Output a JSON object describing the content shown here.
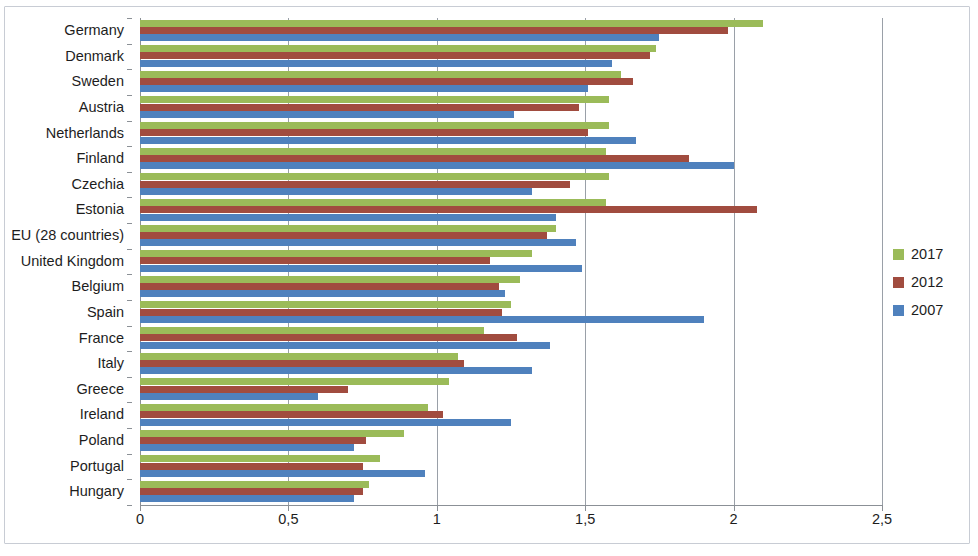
{
  "chart_data": {
    "type": "bar",
    "orientation": "horizontal",
    "title": "",
    "subtitle": "",
    "xlabel": "",
    "ylabel": "",
    "xlim": [
      0,
      2.5
    ],
    "x_ticks": [
      "0",
      "0,5",
      "1",
      "1,5",
      "2",
      "2,5"
    ],
    "x_tick_values": [
      0,
      0.5,
      1,
      1.5,
      2,
      2.5
    ],
    "grid": "vertical",
    "legend_position": "right",
    "categories": [
      "Germany",
      "Denmark",
      "Sweden",
      "Austria",
      "Netherlands",
      "Finland",
      "Czechia",
      "Estonia",
      "EU (28 countries)",
      "United Kingdom",
      "Belgium",
      "Spain",
      "France",
      "Italy",
      "Greece",
      "Ireland",
      "Poland",
      "Portugal",
      "Hungary"
    ],
    "series": [
      {
        "name": "2017",
        "color": "#9bbb59",
        "values": [
          2.1,
          1.74,
          1.62,
          1.58,
          1.58,
          1.57,
          1.58,
          1.57,
          1.4,
          1.32,
          1.28,
          1.25,
          1.16,
          1.07,
          1.04,
          0.97,
          0.89,
          0.81,
          0.77
        ]
      },
      {
        "name": "2012",
        "color": "#a14c3f",
        "values": [
          1.98,
          1.72,
          1.66,
          1.48,
          1.51,
          1.85,
          1.45,
          2.08,
          1.37,
          1.18,
          1.21,
          1.22,
          1.27,
          1.09,
          0.7,
          1.02,
          0.76,
          0.75,
          0.75
        ]
      },
      {
        "name": "2007",
        "color": "#4f81bd",
        "values": [
          1.75,
          1.59,
          1.51,
          1.26,
          1.67,
          2.0,
          1.32,
          1.4,
          1.47,
          1.49,
          1.23,
          1.9,
          1.38,
          1.32,
          0.6,
          1.25,
          0.72,
          0.96,
          0.72
        ]
      }
    ]
  },
  "legend": {
    "items": [
      {
        "label": "2017",
        "color": "#9bbb59"
      },
      {
        "label": "2012",
        "color": "#a14c3f"
      },
      {
        "label": "2007",
        "color": "#4f81bd"
      }
    ]
  }
}
